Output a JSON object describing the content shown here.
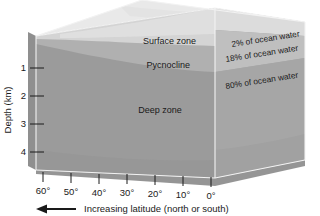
{
  "figure": {
    "type": "diagram",
    "background_color": "#ffffff"
  },
  "axes": {
    "y_axis": {
      "label": "Depth (km)",
      "ticks": [
        "1",
        "2",
        "3",
        "4"
      ],
      "tick_values": [
        1,
        2,
        3,
        4
      ],
      "unit": "km",
      "range": [
        0,
        4.6
      ]
    },
    "x_axis": {
      "ticks": [
        "60°",
        "50°",
        "40°",
        "30°",
        "20°",
        "10°",
        "0°"
      ],
      "tick_values": [
        60,
        50,
        40,
        30,
        20,
        10,
        0
      ],
      "caption": "Increasing latitude (north or south)",
      "arrow_direction": "left"
    }
  },
  "zones": [
    {
      "name": "Surface zone",
      "percent_label": "2% of ocean water",
      "percent": 2,
      "fill": "#e6e6e6"
    },
    {
      "name": "Pycnocline",
      "percent_label": "18% of ocean water",
      "percent": 18,
      "fill": "#b4b4b4"
    },
    {
      "name": "Deep zone",
      "percent_label": "80% of ocean water",
      "percent": 80,
      "fill": "#9a9a9a"
    }
  ],
  "colors": {
    "top_face": "#e9e9e9",
    "front_surface": "#d2d2d2",
    "front_pycnocline": "#b0b0b0",
    "front_deep": "#9b9b9b",
    "left_face": "#8f8f8f",
    "right_surface": "#d8d8d8",
    "right_pycnocline": "#bdbdbd",
    "right_deep": "#a6a6a6",
    "bottom_face": "#8a8a8a",
    "edge": "#f2f2f2",
    "text": "#1a1a1a"
  }
}
